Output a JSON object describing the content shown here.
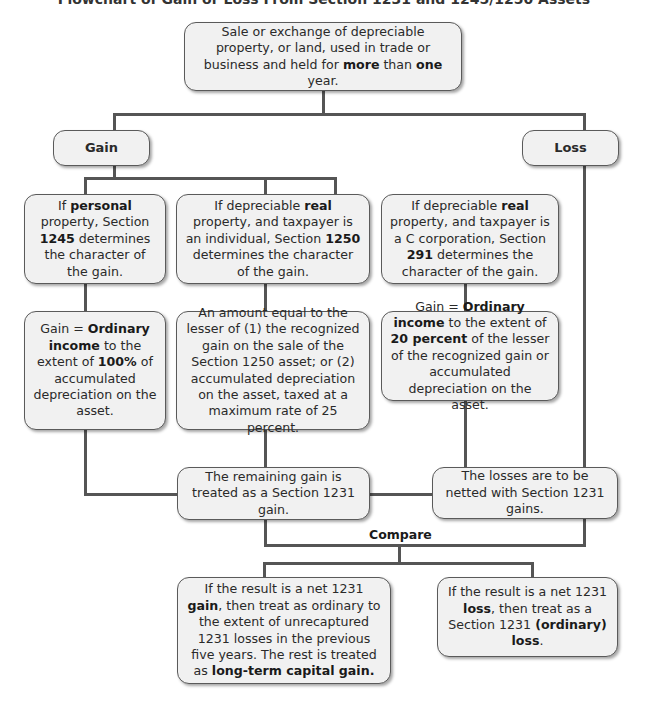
{
  "title": "Flowchart of Gain or Loss From Section 1231 and 1245/1250 Assets",
  "colors": {
    "box_fill": "#f1f1f1",
    "border": "#5a5a5a",
    "connector": "#555555"
  },
  "nodes": {
    "start": {
      "parts": [
        {
          "t": "Sale or exchange of depreciable property, or land, used in trade or business and held for ",
          "b": false
        },
        {
          "t": "more",
          "b": true
        },
        {
          "t": " than ",
          "b": false
        },
        {
          "t": "one",
          "b": true
        },
        {
          "t": " year.",
          "b": false
        }
      ]
    },
    "gain": {
      "label": "Gain"
    },
    "loss": {
      "label": "Loss"
    },
    "personal": {
      "parts": [
        {
          "t": "If ",
          "b": false
        },
        {
          "t": "personal",
          "b": true
        },
        {
          "t": " property, Section ",
          "b": false
        },
        {
          "t": "1245",
          "b": true
        },
        {
          "t": " determines the character of the gain.",
          "b": false
        }
      ]
    },
    "real_individual": {
      "parts": [
        {
          "t": "If depreciable ",
          "b": false
        },
        {
          "t": "real",
          "b": true
        },
        {
          "t": " property, and taxpayer is an individual, Section ",
          "b": false
        },
        {
          "t": "1250",
          "b": true
        },
        {
          "t": " determines the character of the gain.",
          "b": false
        }
      ]
    },
    "real_corp": {
      "parts": [
        {
          "t": "If depreciable ",
          "b": false
        },
        {
          "t": "real",
          "b": true
        },
        {
          "t": " property, and taxpayer is a C corporation, Section ",
          "b": false
        },
        {
          "t": "291",
          "b": true
        },
        {
          "t": " determines the character of the gain.",
          "b": false
        }
      ]
    },
    "personal_result": {
      "parts": [
        {
          "t": "Gain = ",
          "b": false
        },
        {
          "t": "Ordinary income",
          "b": true
        },
        {
          "t": " to the extent of ",
          "b": false
        },
        {
          "t": "100%",
          "b": true
        },
        {
          "t": " of accumulated depreciation on the asset.",
          "b": false
        }
      ]
    },
    "real_individual_result": {
      "parts": [
        {
          "t": "An amount equal to the lesser of (1) the recognized gain on the sale of the Section 1250 asset; or (2) accumulated depreciation on the asset, taxed at a maximum rate of 25 percent.",
          "b": false
        }
      ]
    },
    "real_corp_result": {
      "parts": [
        {
          "t": "Gain = ",
          "b": false
        },
        {
          "t": "Ordinary income",
          "b": true
        },
        {
          "t": " to the extent of ",
          "b": false
        },
        {
          "t": "20 percent",
          "b": true
        },
        {
          "t": " of the lesser of the recognized gain or accumulated depreciation on the asset.",
          "b": false
        }
      ]
    },
    "remaining_gain": {
      "parts": [
        {
          "t": "The remaining gain is treated as a Section 1231 gain.",
          "b": false
        }
      ]
    },
    "losses_netted": {
      "parts": [
        {
          "t": "The losses are to be netted with Section 1231 gains.",
          "b": false
        }
      ]
    },
    "compare": {
      "label": "Compare"
    },
    "net_gain": {
      "parts": [
        {
          "t": "If the result is a net 1231 ",
          "b": false
        },
        {
          "t": "gain",
          "b": true
        },
        {
          "t": ", then treat as ordinary to the extent of unrecaptured 1231 losses in the previous five years. The rest is treated as ",
          "b": false
        },
        {
          "t": "long-term capital gain.",
          "b": true
        }
      ]
    },
    "net_loss": {
      "parts": [
        {
          "t": "If the result is a net 1231 ",
          "b": false
        },
        {
          "t": "loss",
          "b": true
        },
        {
          "t": ", then treat as a Section 1231 ",
          "b": false
        },
        {
          "t": "(ordinary) loss",
          "b": true
        },
        {
          "t": ".",
          "b": false
        }
      ]
    }
  }
}
